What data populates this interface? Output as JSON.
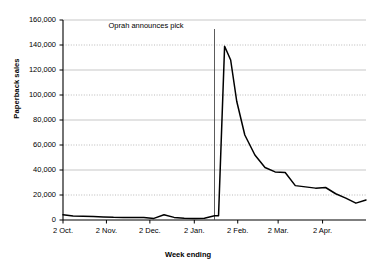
{
  "chart_data": {
    "type": "line",
    "title": "",
    "xlabel": "Week ending",
    "ylabel": "Paperback sales",
    "ylim": [
      0,
      160000
    ],
    "yticks": [
      "0",
      "20,000",
      "40,000",
      "60,000",
      "80,000",
      "100,000",
      "120,000",
      "140,000",
      "160,000"
    ],
    "ytick_values": [
      0,
      20000,
      40000,
      60000,
      80000,
      100000,
      120000,
      140000,
      160000
    ],
    "xticks": [
      "2 Oct.",
      "2 Nov.",
      "2 Dec.",
      "2 Jan.",
      "2 Feb.",
      "2 Mar.",
      "2 Apr."
    ],
    "xtick_values": [
      0,
      4.3,
      8.6,
      13.0,
      17.3,
      21.3,
      25.7
    ],
    "grid": true,
    "legend": false,
    "annotations": [
      {
        "text": "Oprah announces pick",
        "x_week": 15.0,
        "leader_line": true
      }
    ],
    "series": [
      {
        "name": "Paperback sales",
        "color": "#000000",
        "x": [
          0,
          1,
          2,
          3,
          4,
          5,
          6,
          7,
          8,
          9,
          10,
          11,
          12,
          13,
          14,
          15,
          15.4,
          16,
          16.6,
          17.2,
          18,
          19,
          20,
          21,
          22,
          23,
          24,
          25,
          26,
          27,
          28,
          29,
          30
        ],
        "values": [
          4200,
          3200,
          3000,
          2900,
          2500,
          2200,
          2100,
          2000,
          2100,
          1300,
          4200,
          2100,
          1400,
          1300,
          1400,
          3400,
          3400,
          139000,
          128000,
          95000,
          68000,
          52000,
          42000,
          38500,
          38000,
          27500,
          26500,
          25500,
          26000,
          21000,
          17500,
          13500,
          16000
        ]
      }
    ]
  }
}
